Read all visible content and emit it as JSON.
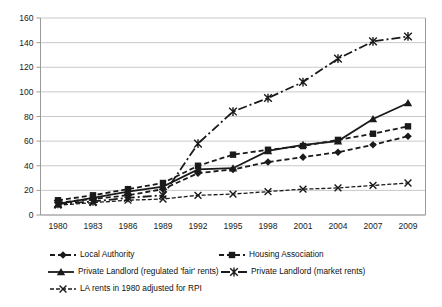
{
  "chart_data": {
    "type": "line",
    "title": "",
    "xlabel": "",
    "ylabel": "",
    "x_categories": [
      "1980",
      "1983",
      "1986",
      "1989",
      "1992",
      "1995",
      "1998",
      "2001",
      "2004",
      "2007",
      "2009"
    ],
    "ylim": [
      0,
      160
    ],
    "y_ticks": [
      0,
      20,
      40,
      60,
      80,
      100,
      120,
      140,
      160
    ],
    "grid": "horizontal",
    "legend_position": "bottom",
    "axis_color": "#9a9a9a",
    "gridline_color": "#c9c9c9",
    "series_color": "#1a1a1a",
    "series": [
      {
        "name": "Local Authority",
        "marker": "diamond",
        "line": "dashed",
        "color": "#1a1a1a",
        "values": [
          10,
          13,
          16,
          21,
          34,
          37,
          43,
          47,
          51,
          57,
          64
        ]
      },
      {
        "name": "Housing Association",
        "marker": "square",
        "line": "dashed",
        "color": "#1a1a1a",
        "values": [
          12,
          16,
          21,
          26,
          40,
          49,
          53,
          56,
          61,
          66,
          72
        ]
      },
      {
        "name": "Private Landlord (regulated 'fair' rents)",
        "marker": "triangle",
        "line": "solid",
        "color": "#1a1a1a",
        "values": [
          9,
          14,
          19,
          23,
          37,
          38,
          52,
          57,
          60,
          78,
          91
        ]
      },
      {
        "name": "Private Landlord (market rents)",
        "marker": "asterisk",
        "line": "dashdot",
        "color": "#1a1a1a",
        "values": [
          9,
          11,
          14,
          16,
          58,
          84,
          95,
          108,
          127,
          141,
          145
        ]
      },
      {
        "name": "LA rents in 1980 adjusted for RPI",
        "marker": "x",
        "line": "shortdash",
        "color": "#1a1a1a",
        "values": [
          8,
          10,
          12,
          13,
          16,
          17,
          19,
          21,
          22,
          24,
          26
        ]
      }
    ]
  }
}
